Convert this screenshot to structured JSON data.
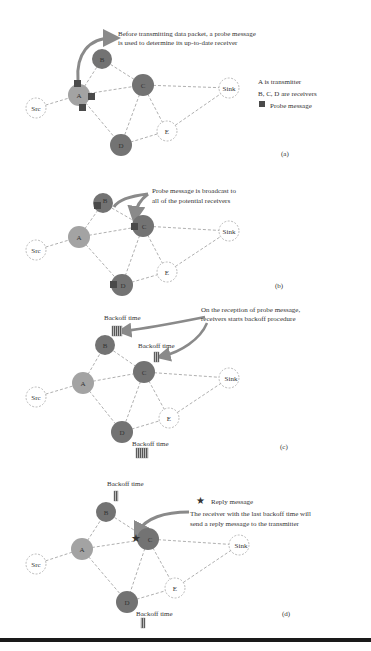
{
  "colors": {
    "receiver_fill": "#737373",
    "transmitter_fill": "#a3a3a3",
    "probe": "#4a4a4a",
    "arrow": "#8a8a8a",
    "edge": "#9a9a9a",
    "text": "#3a3a3a"
  },
  "node_labels": {
    "src": "Src",
    "a": "A",
    "b": "B",
    "c": "C",
    "d": "D",
    "e": "E",
    "sink": "Sink"
  },
  "panels": [
    {
      "id": "a",
      "caption": "(a)",
      "annotation": [
        "Before transmitting data packet, a probe message",
        "is used to determine its up-to-date receiver"
      ],
      "legend": [
        "A is transmitter",
        "B, C, D are receivers",
        "Probe message"
      ]
    },
    {
      "id": "b",
      "caption": "(b)",
      "annotation": [
        "Probe message is broadcast to",
        "all of the potential receivers"
      ]
    },
    {
      "id": "c",
      "caption": "(c)",
      "annotation": [
        "On the reception of probe message,",
        "receivers starts backoff procedure"
      ],
      "backoff_label": "Backoff time"
    },
    {
      "id": "d",
      "caption": "(d)",
      "legend": [
        "Reply message"
      ],
      "annotation": [
        "The receiver with the last backoff time will",
        "send a reply message to the transmitter"
      ],
      "backoff_label": "Backoff time"
    }
  ]
}
